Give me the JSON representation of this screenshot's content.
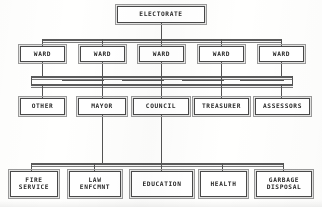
{
  "diagram": {
    "type": "organization-chart",
    "line_color": "#555555",
    "box_border_color": "#4a4a4a",
    "background_color": "#ffffff",
    "text_color": "#2b2b2b"
  },
  "tiers": [
    {
      "id": "electorate",
      "level": 1,
      "nodes": [
        {
          "id": "electorate",
          "label": "ELECTORATE"
        }
      ]
    },
    {
      "id": "wards",
      "level": 2,
      "nodes": [
        {
          "id": "ward-1",
          "label": "WARD"
        },
        {
          "id": "ward-2",
          "label": "WARD"
        },
        {
          "id": "ward-3",
          "label": "WARD"
        },
        {
          "id": "ward-4",
          "label": "WARD"
        },
        {
          "id": "ward-5",
          "label": "WARD"
        }
      ]
    },
    {
      "id": "officials",
      "level": 3,
      "nodes": [
        {
          "id": "other",
          "label": "OTHER"
        },
        {
          "id": "mayor",
          "label": "MAYOR"
        },
        {
          "id": "council",
          "label": "COUNCIL"
        },
        {
          "id": "treasurer",
          "label": "TREASURER"
        },
        {
          "id": "assessors",
          "label": "ASSESSORS"
        }
      ]
    },
    {
      "id": "departments",
      "level": 4,
      "nodes": [
        {
          "id": "fire-service",
          "label": "FIRE\nSERVICE"
        },
        {
          "id": "law-enforcement",
          "label": "LAW\nENFCMNT"
        },
        {
          "id": "education",
          "label": "EDUCATION"
        },
        {
          "id": "health",
          "label": "HEALTH"
        },
        {
          "id": "garbage-disposal",
          "label": "GARBAGE\nDISPOSAL"
        }
      ]
    }
  ]
}
